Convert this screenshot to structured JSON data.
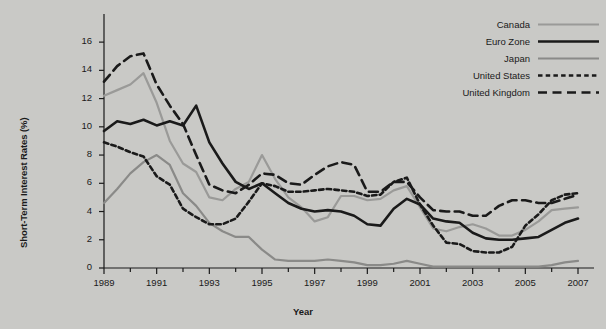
{
  "chart_data": {
    "type": "line",
    "title": "",
    "xlabel": "Year",
    "ylabel": "Short-Term Interest Rates (%)",
    "xlim": [
      1989,
      2007
    ],
    "ylim": [
      0,
      17
    ],
    "yticks": [
      0,
      2,
      4,
      6,
      8,
      10,
      12,
      14,
      16
    ],
    "xticks": [
      1989,
      1991,
      1993,
      1995,
      1997,
      1999,
      2001,
      2003,
      2005,
      2007
    ],
    "xtick_labels": [
      "1989",
      "1991",
      "1993",
      "1995",
      "1997",
      "1999",
      "2001",
      "2003",
      "2005",
      "2007"
    ],
    "ytick_labels": [
      "0",
      "2",
      "4",
      "6",
      "8",
      "10",
      "12",
      "14",
      "16"
    ],
    "x_minor_step": 1,
    "grid": false,
    "legend_position": "top-right",
    "x": [
      1989,
      1989.5,
      1990,
      1990.5,
      1991,
      1991.5,
      1992,
      1992.5,
      1993,
      1993.5,
      1994,
      1994.5,
      1995,
      1995.5,
      1996,
      1996.5,
      1997,
      1997.5,
      1998,
      1998.5,
      1999,
      1999.5,
      2000,
      2000.5,
      2001,
      2001.5,
      2002,
      2002.5,
      2003,
      2003.5,
      2004,
      2004.5,
      2005,
      2005.5,
      2006,
      2006.5,
      2007
    ],
    "series": [
      {
        "name": "Canada",
        "color": "#9a9a98",
        "style": "solid",
        "width": 2.2,
        "values": [
          12.2,
          12.6,
          13.0,
          13.8,
          11.7,
          9.0,
          7.4,
          6.8,
          5.0,
          4.8,
          5.6,
          6.1,
          8.0,
          6.3,
          5.0,
          4.3,
          3.3,
          3.6,
          5.1,
          5.1,
          4.8,
          4.9,
          5.5,
          5.8,
          4.3,
          2.8,
          2.6,
          2.9,
          3.1,
          2.8,
          2.3,
          2.3,
          2.7,
          3.3,
          4.1,
          4.2,
          4.3
        ]
      },
      {
        "name": "Euro Zone",
        "color": "#1a1a1a",
        "style": "solid",
        "width": 2.6,
        "values": [
          9.7,
          10.4,
          10.2,
          10.5,
          10.1,
          10.4,
          10.1,
          11.5,
          8.9,
          7.4,
          6.1,
          5.6,
          6.0,
          5.3,
          4.6,
          4.2,
          4.0,
          4.1,
          4.0,
          3.7,
          3.1,
          3.0,
          4.2,
          4.9,
          4.5,
          3.5,
          3.3,
          3.2,
          2.5,
          2.1,
          2.0,
          2.0,
          2.1,
          2.2,
          2.7,
          3.2,
          3.5
        ]
      },
      {
        "name": "Japan",
        "color": "#8a8a88",
        "style": "solid",
        "width": 2.2,
        "values": [
          4.6,
          5.6,
          6.7,
          7.5,
          8.0,
          7.3,
          5.3,
          4.4,
          3.2,
          2.6,
          2.2,
          2.2,
          1.3,
          0.6,
          0.5,
          0.5,
          0.5,
          0.6,
          0.5,
          0.4,
          0.2,
          0.2,
          0.3,
          0.5,
          0.3,
          0.1,
          0.1,
          0.1,
          0.1,
          0.1,
          0.1,
          0.1,
          0.1,
          0.1,
          0.2,
          0.4,
          0.5
        ]
      },
      {
        "name": "United States",
        "color": "#1a1a1a",
        "style": "dotted",
        "width": 2.6,
        "values": [
          8.9,
          8.6,
          8.2,
          7.9,
          6.5,
          5.9,
          4.2,
          3.6,
          3.1,
          3.1,
          3.5,
          4.7,
          6.0,
          5.8,
          5.4,
          5.4,
          5.5,
          5.6,
          5.5,
          5.4,
          5.1,
          5.2,
          6.1,
          6.4,
          4.5,
          3.0,
          1.8,
          1.7,
          1.2,
          1.1,
          1.1,
          1.5,
          3.0,
          3.8,
          4.8,
          5.2,
          5.3
        ]
      },
      {
        "name": "United Kingdom",
        "color": "#1a1a1a",
        "style": "dashed",
        "width": 2.6,
        "values": [
          13.2,
          14.3,
          15.0,
          15.2,
          13.0,
          11.5,
          10.2,
          8.0,
          5.9,
          5.5,
          5.3,
          5.9,
          6.7,
          6.6,
          6.0,
          5.9,
          6.6,
          7.2,
          7.5,
          7.3,
          5.4,
          5.4,
          6.1,
          6.1,
          5.0,
          4.1,
          4.0,
          4.0,
          3.7,
          3.7,
          4.4,
          4.8,
          4.8,
          4.6,
          4.6,
          4.9,
          5.2
        ]
      }
    ],
    "legend": [
      {
        "label": "Canada",
        "swatch": "solid-light-gray"
      },
      {
        "label": "Euro Zone",
        "swatch": "solid-black-thick"
      },
      {
        "label": "Japan",
        "swatch": "solid-gray"
      },
      {
        "label": "United States",
        "swatch": "dotted-black"
      },
      {
        "label": "United Kingdom",
        "swatch": "dashed-black"
      }
    ]
  },
  "axes": {
    "y_title": "Short-Term Interest Rates (%)",
    "x_title": "Year"
  }
}
